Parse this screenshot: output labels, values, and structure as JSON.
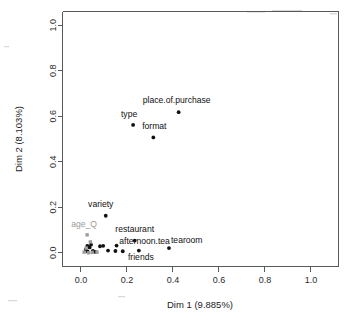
{
  "chart_data": {
    "type": "scatter",
    "title": "",
    "xlabel": "Dim 1 (9.885%)",
    "ylabel": "Dim 2 (8.103%)",
    "xlim": [
      -0.08,
      1.12
    ],
    "ylim": [
      -0.06,
      1.06
    ],
    "xticks": [
      "0.0",
      "0.2",
      "0.4",
      "0.6",
      "0.8",
      "1.0"
    ],
    "xtick_values": [
      0.0,
      0.2,
      0.4,
      0.6,
      0.8,
      1.0
    ],
    "yticks": [
      "0.0",
      "0.2",
      "0.4",
      "0.6",
      "0.8",
      "1.0"
    ],
    "ytick_values": [
      0.0,
      0.2,
      0.4,
      0.6,
      0.8,
      1.0
    ],
    "grid": false,
    "legend": "none",
    "series": [
      {
        "name": "active variables",
        "color": "#111111",
        "points": [
          {
            "label": "place.of.purchase",
            "x": 0.425,
            "y": 0.618,
            "label_dx": -2,
            "label_dy": -9,
            "label_anchor": "middle"
          },
          {
            "label": "type",
            "x": 0.227,
            "y": 0.562,
            "label_dx": -4,
            "label_dy": -8,
            "label_anchor": "middle"
          },
          {
            "label": "format",
            "x": 0.315,
            "y": 0.507,
            "label_dx": 1,
            "label_dy": -8,
            "label_anchor": "middle"
          },
          {
            "label": "variety",
            "x": 0.108,
            "y": 0.163,
            "label_dx": -5,
            "label_dy": -9,
            "label_anchor": "middle"
          },
          {
            "label": "restaurant",
            "x": 0.234,
            "y": 0.054,
            "label_dx": 0,
            "label_dy": -9,
            "label_anchor": "middle"
          },
          {
            "label": "afternoon.tea",
            "x": 0.155,
            "y": 0.032,
            "label_dx": 28,
            "label_dy": -2,
            "label_anchor": "middle"
          },
          {
            "label": "tearoom",
            "x": 0.383,
            "y": 0.021,
            "label_dx": 2,
            "label_dy": -5,
            "label_anchor": "start"
          },
          {
            "label": "friends",
            "x": 0.252,
            "y": 0.01,
            "label_dx": 2,
            "label_dy": 9,
            "label_anchor": "middle"
          },
          {
            "label": "",
            "x": 0.028,
            "y": 0.03,
            "label_dx": 0,
            "label_dy": 0,
            "label_anchor": "middle"
          },
          {
            "label": "",
            "x": 0.038,
            "y": 0.024,
            "label_dx": 0,
            "label_dy": 0,
            "label_anchor": "middle"
          },
          {
            "label": "",
            "x": 0.044,
            "y": 0.036,
            "label_dx": 0,
            "label_dy": 0,
            "label_anchor": "middle"
          },
          {
            "label": "",
            "x": 0.021,
            "y": 0.014,
            "label_dx": 0,
            "label_dy": 0,
            "label_anchor": "middle"
          },
          {
            "label": "",
            "x": 0.029,
            "y": 0.006,
            "label_dx": 0,
            "label_dy": 0,
            "label_anchor": "middle"
          },
          {
            "label": "",
            "x": 0.052,
            "y": 0.009,
            "label_dx": 0,
            "label_dy": 0,
            "label_anchor": "middle"
          },
          {
            "label": "",
            "x": 0.063,
            "y": 0.004,
            "label_dx": 0,
            "label_dy": 0,
            "label_anchor": "middle"
          },
          {
            "label": "",
            "x": 0.083,
            "y": 0.029,
            "label_dx": 0,
            "label_dy": 0,
            "label_anchor": "middle"
          },
          {
            "label": "",
            "x": 0.097,
            "y": 0.031,
            "label_dx": 0,
            "label_dy": 0,
            "label_anchor": "middle"
          },
          {
            "label": "",
            "x": 0.118,
            "y": 0.01,
            "label_dx": 0,
            "label_dy": 0,
            "label_anchor": "middle"
          },
          {
            "label": "",
            "x": 0.15,
            "y": 0.008,
            "label_dx": 0,
            "label_dy": 0,
            "label_anchor": "middle"
          },
          {
            "label": "",
            "x": 0.182,
            "y": 0.007,
            "label_dx": 0,
            "label_dy": 0,
            "label_anchor": "middle"
          }
        ]
      },
      {
        "name": "supplementary variables",
        "color": "#9d9d9d",
        "points": [
          {
            "label": "age_Q",
            "x": 0.027,
            "y": 0.079,
            "label_dx": -3,
            "label_dy": -8,
            "label_anchor": "middle"
          },
          {
            "label": "",
            "x": 0.041,
            "y": 0.048,
            "label_dx": 0,
            "label_dy": 0,
            "label_anchor": "middle"
          },
          {
            "label": "",
            "x": 0.023,
            "y": 0.021,
            "label_dx": 0,
            "label_dy": 0,
            "label_anchor": "middle"
          },
          {
            "label": "",
            "x": 0.014,
            "y": 0.003,
            "label_dx": 0,
            "label_dy": 0,
            "label_anchor": "middle"
          },
          {
            "label": "",
            "x": 0.049,
            "y": 0.002,
            "label_dx": 0,
            "label_dy": 0,
            "label_anchor": "middle"
          },
          {
            "label": "",
            "x": 0.07,
            "y": 0.003,
            "label_dx": 0,
            "label_dy": 0,
            "label_anchor": "middle"
          },
          {
            "label": "",
            "x": 0.033,
            "y": 0.0,
            "label_dx": 0,
            "label_dy": 0,
            "label_anchor": "middle"
          }
        ]
      }
    ]
  }
}
